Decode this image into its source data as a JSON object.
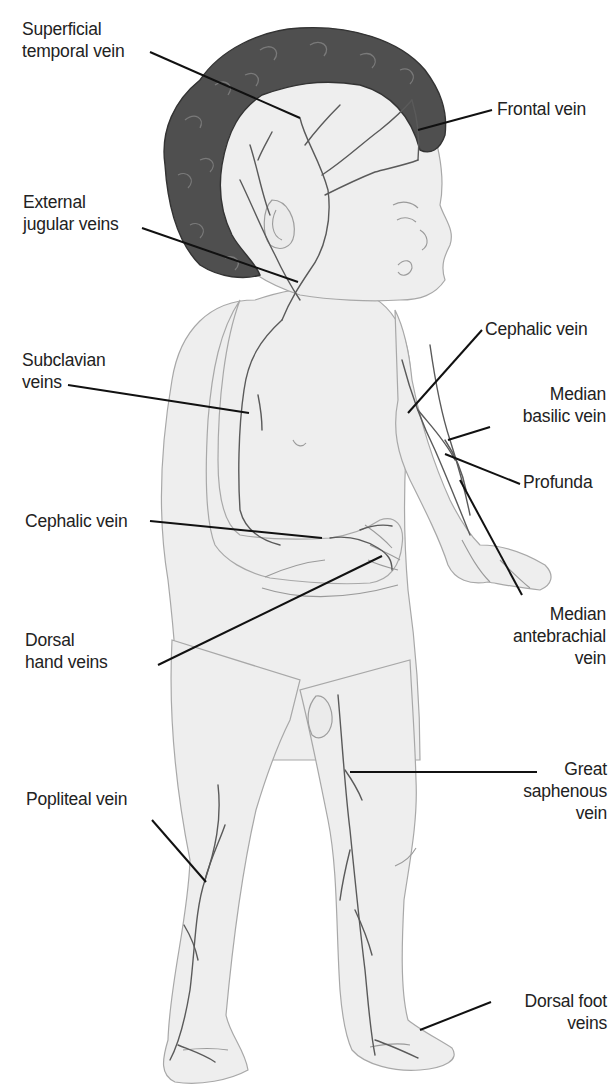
{
  "diagram": {
    "colors": {
      "background": "#ffffff",
      "skin": "#eeeeee",
      "outline": "#a8a8a8",
      "hair": "#4f4f4f",
      "vein": "#5a5a5a",
      "leader_line": "#111111",
      "label_text": "#222222"
    },
    "labels": {
      "superficial_temporal_vein": {
        "lines": [
          "Superficial",
          "temporal vein"
        ]
      },
      "frontal_vein": {
        "lines": [
          "Frontal vein"
        ]
      },
      "external_jugular_veins": {
        "lines": [
          "External",
          "jugular veins"
        ]
      },
      "subclavian_veins": {
        "lines": [
          "Subclavian",
          "veins"
        ]
      },
      "cephalic_vein_left": {
        "lines": [
          "Cephalic vein"
        ]
      },
      "dorsal_hand_veins": {
        "lines": [
          "Dorsal",
          "hand veins"
        ]
      },
      "popliteal_vein": {
        "lines": [
          "Popliteal vein"
        ]
      },
      "cephalic_vein_right": {
        "lines": [
          "Cephalic vein"
        ]
      },
      "median_basilic_vein": {
        "lines": [
          "Median",
          "basilic vein"
        ]
      },
      "profunda": {
        "lines": [
          "Profunda"
        ]
      },
      "median_antebrachial_vein": {
        "lines": [
          "Median",
          "antebrachial",
          "vein"
        ]
      },
      "great_saphenous_vein": {
        "lines": [
          "Great",
          "saphenous",
          "vein"
        ]
      },
      "dorsal_foot_veins": {
        "lines": [
          "Dorsal foot",
          "veins"
        ]
      }
    }
  }
}
